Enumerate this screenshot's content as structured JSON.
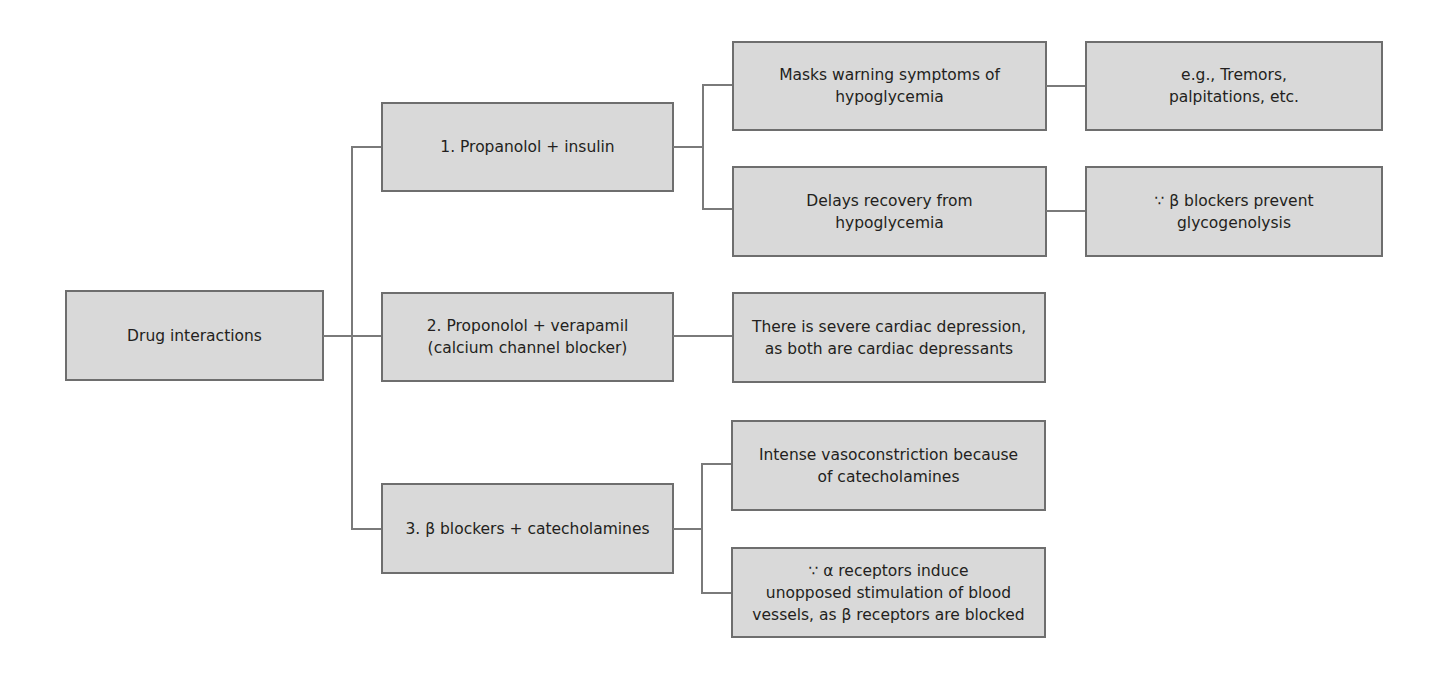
{
  "diagram": {
    "type": "tree",
    "orientation": "left-to-right",
    "colors": {
      "box_fill": "#d9d9d9",
      "box_border": "#6e6e6e",
      "connector": "#7a7a7a",
      "text": "#231f20"
    },
    "root": {
      "label": "Drug interactions"
    },
    "branches": [
      {
        "label": "1. Propanolol + insulin",
        "effects": [
          {
            "label": "Masks warning symptoms of\nhypoglycemia",
            "detail": "e.g., Tremors,\npalpitations, etc."
          },
          {
            "label": "Delays recovery from\nhypoglycemia",
            "detail": "∵ β blockers prevent\nglycogenolysis"
          }
        ]
      },
      {
        "label": "2. Proponolol + verapamil\n(calcium channel blocker)",
        "effects": [
          {
            "label": "There is severe cardiac depression,\nas both are cardiac depressants"
          }
        ]
      },
      {
        "label": "3. β blockers + catecholamines",
        "effects": [
          {
            "label": "Intense vasoconstriction because\nof catecholamines"
          },
          {
            "label": "∵ α receptors induce\nunopposed stimulation of blood\nvessels, as β receptors are blocked"
          }
        ]
      }
    ]
  }
}
